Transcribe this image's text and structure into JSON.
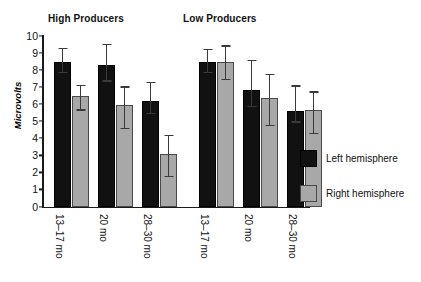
{
  "chart_data": {
    "type": "bar",
    "title": "",
    "xlabel": "",
    "ylabel": "Microvolts",
    "ylim": [
      0,
      10
    ],
    "ytick_values": [
      0,
      1,
      2,
      3,
      4,
      5,
      6,
      7,
      8,
      9,
      10
    ],
    "ytick_labels": [
      "0",
      "1",
      "2",
      "3",
      "4",
      "5",
      "6",
      "7",
      "8",
      "9",
      "10"
    ],
    "grid": false,
    "legend_position": "right",
    "group_titles": [
      "High Producers",
      "Low Producers"
    ],
    "categories": [
      "13–17 mo",
      "20 mo",
      "28–30 mo",
      "13–17 mo",
      "20 mo",
      "28–30 mo"
    ],
    "series": [
      {
        "name": "Left hemisphere",
        "color": "#111111",
        "values": [
          8.4,
          8.2,
          6.1,
          8.4,
          6.75,
          5.5
        ],
        "err_low": [
          7.9,
          7.4,
          5.5,
          7.9,
          5.9,
          5.0
        ],
        "err_high": [
          9.3,
          9.55,
          7.3,
          9.25,
          8.6,
          7.1
        ]
      },
      {
        "name": "Right hemisphere",
        "color": "#a8a8a8",
        "values": [
          6.4,
          5.85,
          3.0,
          8.4,
          6.3,
          5.55
        ],
        "err_low": [
          5.7,
          4.6,
          1.8,
          7.5,
          4.8,
          4.3
        ],
        "err_high": [
          7.15,
          7.05,
          4.2,
          9.45,
          7.8,
          6.75
        ]
      }
    ],
    "bars": [
      {
        "group": 0,
        "series": 0,
        "category": "13–17 mo",
        "value": 8.4,
        "err_low": 7.9,
        "err_high": 9.3,
        "x": 12
      },
      {
        "group": 0,
        "series": 1,
        "category": "13–17 mo",
        "value": 6.4,
        "err_low": 5.7,
        "err_high": 7.15,
        "x": 30
      },
      {
        "group": 0,
        "series": 0,
        "category": "20 mo",
        "value": 8.2,
        "err_low": 7.4,
        "err_high": 9.55,
        "x": 56
      },
      {
        "group": 0,
        "series": 1,
        "category": "20 mo",
        "value": 5.85,
        "err_low": 4.6,
        "err_high": 7.05,
        "x": 74
      },
      {
        "group": 0,
        "series": 0,
        "category": "28–30 mo",
        "value": 6.1,
        "err_low": 5.5,
        "err_high": 7.3,
        "x": 100
      },
      {
        "group": 0,
        "series": 1,
        "category": "28–30 mo",
        "value": 3.0,
        "err_low": 1.8,
        "err_high": 4.2,
        "x": 118
      },
      {
        "group": 1,
        "series": 0,
        "category": "13–17 mo",
        "value": 8.4,
        "err_low": 7.9,
        "err_high": 9.25,
        "x": 157
      },
      {
        "group": 1,
        "series": 1,
        "category": "13–17 mo",
        "value": 8.4,
        "err_low": 7.5,
        "err_high": 9.45,
        "x": 175
      },
      {
        "group": 1,
        "series": 0,
        "category": "20 mo",
        "value": 6.75,
        "err_low": 5.9,
        "err_high": 8.6,
        "x": 201
      },
      {
        "group": 1,
        "series": 1,
        "category": "20 mo",
        "value": 6.3,
        "err_low": 4.8,
        "err_high": 7.8,
        "x": 219
      },
      {
        "group": 1,
        "series": 0,
        "category": "28–30 mo",
        "value": 5.5,
        "err_low": 5.0,
        "err_high": 7.1,
        "x": 245
      },
      {
        "group": 1,
        "series": 1,
        "category": "28–30 mo",
        "value": 5.55,
        "err_low": 4.3,
        "err_high": 6.75,
        "x": 263
      }
    ],
    "xticks": [
      {
        "label": "13–17 mo",
        "x": 65
      },
      {
        "label": "20 mo",
        "x": 109
      },
      {
        "label": "28–30 mo",
        "x": 153
      },
      {
        "label": "13–17 mo",
        "x": 210
      },
      {
        "label": "20 mo",
        "x": 254
      },
      {
        "label": "28–30 mo",
        "x": 298
      }
    ]
  },
  "legend": {
    "items": [
      {
        "label": "Left hemisphere",
        "color": "#111111",
        "swatch": "left"
      },
      {
        "label": "Right hemisphere",
        "color": "#a8a8a8",
        "swatch": "right"
      }
    ]
  }
}
